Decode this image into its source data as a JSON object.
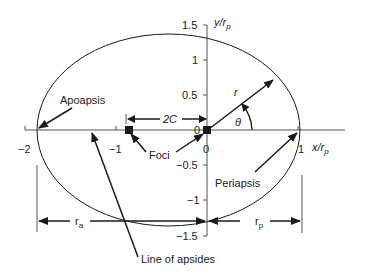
{
  "diagram": {
    "axes": {
      "x_label": "x/r",
      "x_label_sub": "p",
      "y_label": "y/r",
      "y_label_sub": "p",
      "x_ticks": [
        "−2",
        "−1",
        "0",
        "1"
      ],
      "y_ticks": [
        "1.5",
        "1",
        "0.5",
        "0",
        "−0.5",
        "−1",
        "−1.5"
      ]
    },
    "labels": {
      "apoapsis": "Apoapsis",
      "periapsis": "Periapsis",
      "foci": "Foci",
      "two_c": "2C",
      "r": "r",
      "theta": "θ",
      "line_of_apsides": "Line of apsides",
      "r_a": "r",
      "r_a_sub": "a",
      "r_p": "r",
      "r_p_sub": "p"
    },
    "colors": {
      "line": "#1a1a1a",
      "axis": "#555555",
      "text": "#222222"
    }
  }
}
